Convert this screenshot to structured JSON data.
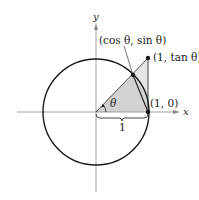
{
  "figure": {
    "axes": {
      "x_label": "x",
      "y_label": "y"
    },
    "points": {
      "circle_point_label": "(cos θ, sin θ)",
      "tangent_point_label": "(1, tan θ)",
      "unit_point_label": "(1, 0)"
    },
    "angle_label": "θ",
    "brace_label": "1",
    "colors": {
      "stroke": "#1a1a1a",
      "axis": "#8a8a8a",
      "shade": "#d6d6d6",
      "shade_light": "#e6e6e6"
    }
  }
}
